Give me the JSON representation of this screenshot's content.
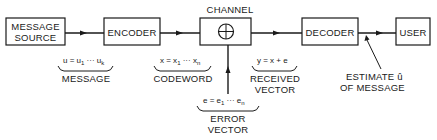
{
  "diagram": {
    "blocks": {
      "source": {
        "line1": "MESSAGE",
        "line2": "SOURCE"
      },
      "encoder": {
        "label": "ENCODER"
      },
      "channel": {
        "label": "CHANNEL"
      },
      "decoder": {
        "label": "DECODER"
      },
      "user": {
        "label": "USER"
      }
    },
    "annotations": {
      "message": {
        "formula": "u = u",
        "sub1": "1",
        "dots": " ··· u",
        "subk": "k",
        "label": "MESSAGE"
      },
      "codeword": {
        "formula": "x = x",
        "sub1": "1",
        "dots": " ··· x",
        "subn": "n",
        "label": "CODEWORD"
      },
      "received": {
        "formula": "y = x + e",
        "line1": "RECEIVED",
        "line2": "VECTOR"
      },
      "error": {
        "formula": "e = e",
        "sub1": "1",
        "dots": " ··· e",
        "subn": "n",
        "line1": "ERROR",
        "line2": "VECTOR"
      },
      "estimate": {
        "line1": "ESTIMATE  û",
        "line2": "OF MESSAGE"
      }
    }
  }
}
